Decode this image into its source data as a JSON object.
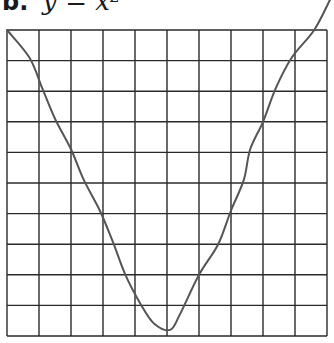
{
  "figure": {
    "label": "b.",
    "equation": "y = x²"
  },
  "chart_data": {
    "type": "line",
    "xlabel": "",
    "ylabel": "",
    "grid": {
      "on": true,
      "columns": 10,
      "rows": 10,
      "line_color": "#2a2a2a"
    },
    "axes_shown": false,
    "tick_labels": false,
    "series": [
      {
        "name": "hand-drawn curve",
        "color": "#555555",
        "shape": "parabola-like (U-shaped, sketched)",
        "points_grid_units": [
          [
            0.0,
            10.0
          ],
          [
            0.7,
            9.1
          ],
          [
            1.1,
            8.1
          ],
          [
            1.5,
            7.1
          ],
          [
            2.0,
            6.1
          ],
          [
            2.4,
            5.1
          ],
          [
            2.9,
            4.1
          ],
          [
            3.3,
            3.1
          ],
          [
            3.7,
            2.0
          ],
          [
            4.2,
            1.0
          ],
          [
            4.6,
            0.4
          ],
          [
            5.1,
            0.2
          ],
          [
            5.4,
            0.7
          ],
          [
            6.0,
            2.0
          ],
          [
            6.6,
            3.0
          ],
          [
            7.0,
            4.1
          ],
          [
            7.4,
            5.1
          ],
          [
            7.6,
            6.1
          ],
          [
            8.0,
            7.0
          ],
          [
            8.4,
            8.1
          ],
          [
            8.9,
            9.1
          ],
          [
            9.6,
            10.0
          ],
          [
            10.1,
            11.0
          ]
        ]
      }
    ],
    "xlim": [
      0,
      10
    ],
    "ylim": [
      0,
      10
    ]
  }
}
